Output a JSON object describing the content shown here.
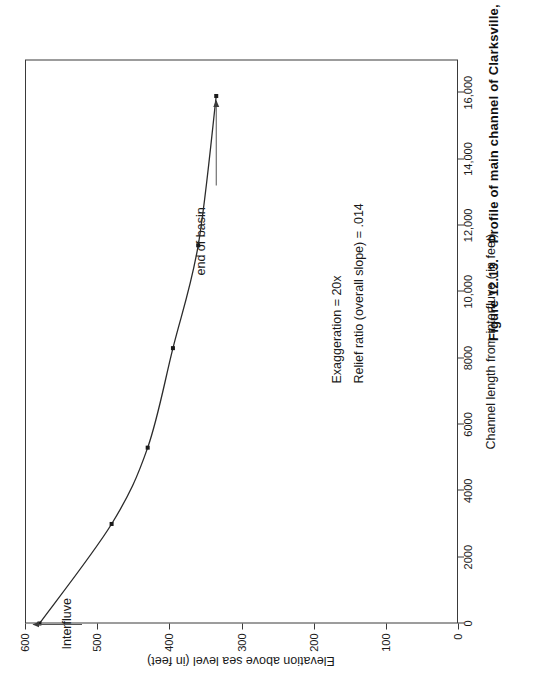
{
  "figure": {
    "number": "Figure 12.13.",
    "caption": "Profile of main channel of Clarksville, MD  watershed."
  },
  "annotations": {
    "exaggeration": "Exaggeration = 20x",
    "relief_ratio": "Relief ratio (overall slope) = .014",
    "start_label": "Interfluve",
    "end_label": "end of basin"
  },
  "chart_data": {
    "type": "line",
    "title": "",
    "xlabel": "Channel length from interfluve ( in feet)",
    "ylabel": "Elevation above sea level (in feet)",
    "xlim": [
      0,
      17000
    ],
    "ylim": [
      0,
      600
    ],
    "grid": false,
    "legend": "none",
    "x_ticks": [
      0,
      2000,
      4000,
      6000,
      8000,
      10000,
      12000,
      14000,
      16000
    ],
    "x_tick_labels": [
      "0",
      "2000",
      "4000",
      "6000",
      "8000",
      "10,000",
      "12,000",
      "14,000",
      "16,000"
    ],
    "y_ticks": [
      0,
      100,
      200,
      300,
      400,
      500,
      600
    ],
    "y_tick_labels": [
      "0",
      "100",
      "200",
      "300",
      "400",
      "500",
      "600"
    ],
    "series": [
      {
        "name": "main channel profile",
        "marker": "square",
        "x": [
          0,
          3000,
          5300,
          8300,
          11400,
          15900
        ],
        "y": [
          580,
          480,
          430,
          395,
          360,
          335
        ]
      }
    ],
    "point_annotations": [
      {
        "label": "Interfluve",
        "x": 0,
        "y": 580
      },
      {
        "label": "end of basin",
        "x": 15900,
        "y": 335
      }
    ]
  }
}
